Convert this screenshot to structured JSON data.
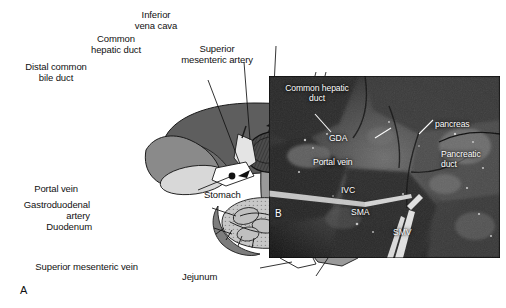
{
  "figure": {
    "type": "two-panel anatomical figure",
    "panels": [
      {
        "letter": "A",
        "kind": "line-art diagram"
      },
      {
        "letter": "B",
        "kind": "intraoperative photograph"
      }
    ]
  },
  "panelA": {
    "letter": "A",
    "labels": [
      {
        "id": "inferior-vena-cava",
        "text": "Inferior\nvena cava"
      },
      {
        "id": "common-hepatic-duct",
        "text": "Common\nhepatic duct"
      },
      {
        "id": "superior-mesenteric-artery",
        "text": "Superior\nmesenteric artery"
      },
      {
        "id": "distal-common-bile-duct",
        "text": "Distal common\nbile duct"
      },
      {
        "id": "stomach",
        "text": "Stomach"
      },
      {
        "id": "portal-vein",
        "text": "Portal vein"
      },
      {
        "id": "gastroduodenal-artery",
        "text": "Gastroduodenal\nartery"
      },
      {
        "id": "duodenum",
        "text": "Duodenum"
      },
      {
        "id": "superior-mesenteric-vein",
        "text": "Superior mesenteric vein"
      },
      {
        "id": "jejunum",
        "text": "Jejunum"
      }
    ],
    "colors": {
      "liver_dark": "#5e5e5e",
      "liver_mid": "#8a8a8a",
      "organ_light": "#b9b9b9",
      "pale": "#e8e8e8",
      "vessel_dark": "#6b6b6b",
      "outline": "#1a1a1a",
      "white": "#ffffff"
    }
  },
  "panelB": {
    "letter": "B",
    "labels": [
      {
        "id": "common-hepatic-duct",
        "text": "Common hepatic\nduct"
      },
      {
        "id": "gda",
        "text": "GDA"
      },
      {
        "id": "portal-vein",
        "text": "Portal vein"
      },
      {
        "id": "ivc",
        "text": "IVC"
      },
      {
        "id": "sma",
        "text": "SMA"
      },
      {
        "id": "smv",
        "text": "SMV"
      },
      {
        "id": "pancreas",
        "text": "pancreas"
      },
      {
        "id": "pancreatic-duct",
        "text": "Pancreatic\nduct"
      }
    ],
    "colors": {
      "tissue_dark": "#1b1b1b",
      "tissue_mid": "#4a4a4a",
      "tissue_light": "#7d7d7d",
      "highlight": "#c9c9c9",
      "instrument": "#dcdcdc",
      "label": "#ffffff"
    }
  }
}
